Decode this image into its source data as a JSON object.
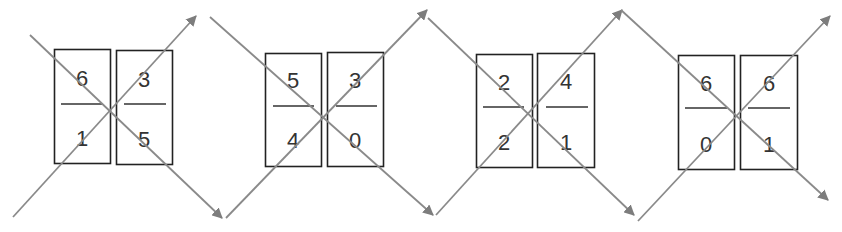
{
  "colors": {
    "arrow": "#8a8a8a",
    "box_stroke": "#222222",
    "text": "#333333",
    "background": "#ffffff"
  },
  "groups": [
    {
      "cards": [
        {
          "numerator": "6",
          "denominator": "1"
        },
        {
          "numerator": "3",
          "denominator": "5"
        }
      ]
    },
    {
      "cards": [
        {
          "numerator": "5",
          "denominator": "4"
        },
        {
          "numerator": "3",
          "denominator": "0"
        }
      ]
    },
    {
      "cards": [
        {
          "numerator": "2",
          "denominator": "2"
        },
        {
          "numerator": "4",
          "denominator": "1"
        }
      ]
    },
    {
      "cards": [
        {
          "numerator": "6",
          "denominator": "0"
        },
        {
          "numerator": "6",
          "denominator": "1"
        }
      ]
    }
  ],
  "arrows": [
    {
      "from": [
        30,
        35
      ],
      "to": [
        222,
        218
      ],
      "icon": "arrow-down-right-icon"
    },
    {
      "from": [
        13,
        217
      ],
      "to": [
        196,
        16
      ],
      "icon": "arrow-up-right-icon"
    },
    {
      "from": [
        210,
        17
      ],
      "to": [
        433,
        215
      ],
      "icon": "arrow-down-right-icon"
    },
    {
      "from": [
        226,
        218
      ],
      "to": [
        427,
        10
      ],
      "icon": "arrow-up-right-icon"
    },
    {
      "from": [
        428,
        18
      ],
      "to": [
        634,
        215
      ],
      "icon": "arrow-down-right-icon"
    },
    {
      "from": [
        436,
        215
      ],
      "to": [
        622,
        10
      ],
      "icon": "arrow-up-right-icon"
    },
    {
      "from": [
        621,
        10
      ],
      "to": [
        828,
        200
      ],
      "icon": "arrow-down-right-icon"
    },
    {
      "from": [
        638,
        221
      ],
      "to": [
        830,
        16
      ],
      "icon": "arrow-up-right-icon"
    }
  ]
}
